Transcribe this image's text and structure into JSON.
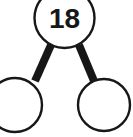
{
  "diagram": {
    "type": "number-bond",
    "colors": {
      "stroke": "#171717",
      "fill": "#ffffff",
      "connector": "#171717",
      "background": "#ffffff"
    },
    "whole": {
      "label": "18",
      "filled": true,
      "cx": 64.5,
      "cy": 18,
      "r": 30
    },
    "parts": [
      {
        "label": "",
        "filled": false,
        "cx": 15,
        "cy": 105,
        "r": 27
      },
      {
        "label": "",
        "filled": false,
        "cx": 104,
        "cy": 105,
        "r": 26
      }
    ],
    "connectors": [
      {
        "name": "connector-left",
        "x1": 51,
        "y1": 45,
        "x2": 35,
        "y2": 81,
        "width": 8
      },
      {
        "name": "connector-right",
        "x1": 79,
        "y1": 45,
        "x2": 94,
        "y2": 81,
        "width": 8
      }
    ]
  }
}
